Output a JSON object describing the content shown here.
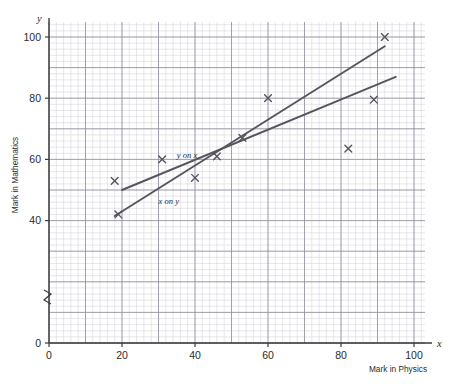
{
  "chart_data": {
    "type": "scatter",
    "title": "",
    "xlabel": "Mark in Physics",
    "ylabel": "Mark in Mathematics",
    "x_axis_symbol": "x",
    "y_axis_symbol": "y",
    "xlim": [
      0,
      104
    ],
    "ylim": [
      0,
      104
    ],
    "grid": true,
    "grid_minor_step": 2,
    "grid_major_step": 10,
    "y_axis_break": true,
    "y_axis_break_range": [
      4,
      36
    ],
    "xticks": [
      0,
      20,
      40,
      60,
      80,
      100
    ],
    "xtick_labels": [
      "0",
      "20",
      "40",
      "60",
      "80",
      "100"
    ],
    "yticks": [
      0,
      40,
      60,
      80,
      100
    ],
    "ytick_labels": [
      "0",
      "40",
      "60",
      "80",
      "100"
    ],
    "points": [
      {
        "x": 18,
        "y": 53
      },
      {
        "x": 19,
        "y": 42
      },
      {
        "x": 31,
        "y": 60
      },
      {
        "x": 40,
        "y": 54
      },
      {
        "x": 46,
        "y": 61
      },
      {
        "x": 53,
        "y": 67
      },
      {
        "x": 60,
        "y": 80
      },
      {
        "x": 82,
        "y": 63.5
      },
      {
        "x": 89,
        "y": 79.5
      },
      {
        "x": 92,
        "y": 100
      }
    ],
    "series": [
      {
        "name": "y on x",
        "type": "line",
        "label": "y on x",
        "label_x": 35,
        "label_y": 60.5,
        "x": [
          20,
          95
        ],
        "values": [
          50,
          87
        ]
      },
      {
        "name": "x on y",
        "type": "line",
        "label": "x on y",
        "label_x": 30,
        "label_y": 45.5,
        "x": [
          18,
          92
        ],
        "values": [
          41.5,
          97
        ]
      }
    ],
    "annotations": [
      {
        "text": "y on x",
        "x": 35,
        "y": 60.5
      },
      {
        "text": "x on y",
        "x": 30,
        "y": 45.5
      }
    ],
    "colors": {
      "line": "#555560",
      "marker": "#52525c",
      "grid_minor": "#c9c9d4",
      "grid_major": "#8e8e9e",
      "axis": "#3a3a3a",
      "text": "#2b2b2b",
      "background": "#ffffff"
    }
  }
}
